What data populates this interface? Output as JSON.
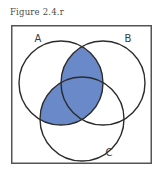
{
  "figure": {
    "caption": "Figure 2.4.r",
    "type": "venn-diagram-3-set",
    "frame": {
      "border_color": "#555555",
      "background_color": "#ffffff",
      "x": 11,
      "y": 25,
      "width": 141,
      "height": 139
    },
    "colors": {
      "shade_fill": "#6a89c9",
      "outline": "#2b2b2b",
      "caption_text": "#4a4a4a",
      "label_text": "#3b3b3b",
      "page_background": "#ffffff"
    },
    "sets": [
      {
        "id": "A",
        "label": "A",
        "label_x": 27,
        "label_y": 17,
        "cx": 50,
        "cy": 58,
        "r": 42
      },
      {
        "id": "B",
        "label": "B",
        "label_x": 117,
        "label_y": 17,
        "cx": 92,
        "cy": 58,
        "r": 42
      },
      {
        "id": "C",
        "label": "C",
        "label_x": 98,
        "label_y": 131,
        "cx": 71,
        "cy": 94,
        "r": 42
      }
    ],
    "shaded_regions": [
      {
        "id": "A-and-B",
        "description": "A intersect B"
      },
      {
        "id": "A-and-C",
        "description": "A intersect C"
      },
      {
        "id": "A-and-B-and-C",
        "description": "A intersect B intersect C"
      }
    ],
    "unshaded_regions": [
      {
        "id": "A-only",
        "description": "A only"
      },
      {
        "id": "B-only",
        "description": "B only"
      },
      {
        "id": "C-only",
        "description": "C only"
      },
      {
        "id": "B-and-C",
        "description": "B intersect C minus A"
      }
    ],
    "shaded_expression": "A ∩ (B ∪ C)"
  }
}
